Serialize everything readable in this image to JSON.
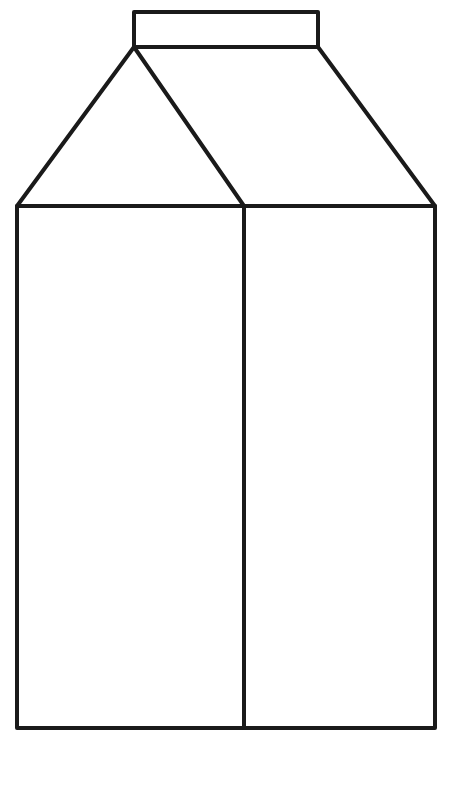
{
  "canvas": {
    "width": 468,
    "height": 796,
    "background": "#ffffff"
  },
  "style": {
    "stroke": "#1a1a1a",
    "stroke_width": 4
  },
  "carton": {
    "cap": {
      "x": 134,
      "y": 12,
      "width": 184,
      "height": 35
    },
    "body": {
      "left": 17,
      "right": 435,
      "top": 206,
      "bottom": 728,
      "divider_x": 244
    },
    "roof": {
      "apex_left": [
        134,
        47
      ],
      "apex_right": [
        318,
        47
      ],
      "front_left": [
        17,
        206
      ],
      "front_right": [
        244,
        206
      ],
      "side_right": [
        435,
        206
      ]
    }
  }
}
